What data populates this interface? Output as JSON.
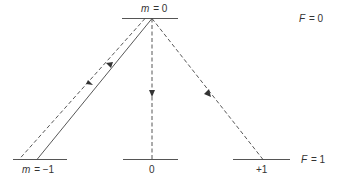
{
  "diagram": {
    "levels": {
      "upper": {
        "F_label": "F = 0",
        "F_symbol": "F",
        "F_value": "= 0",
        "sublevels": [
          {
            "m_label_symbol": "m",
            "m_label_value": "= 0"
          }
        ]
      },
      "lower": {
        "F_label": "F = 1",
        "F_symbol": "F",
        "F_value": "= 1",
        "sublevels": [
          {
            "m_label_symbol": "m",
            "m_label_value": "= −1"
          },
          {
            "m_label": "0"
          },
          {
            "m_label": "+1"
          }
        ]
      }
    },
    "transitions": [
      {
        "from": "F=1, m=-1",
        "to": "F=0, m=0",
        "style": "solid",
        "direction": "up"
      },
      {
        "from": "F=0, m=0",
        "to": "F=1, m=-1",
        "style": "dashed",
        "direction": "down"
      },
      {
        "from": "F=0, m=0",
        "to": "F=1, m=0",
        "style": "dashed",
        "direction": "down"
      },
      {
        "from": "F=0, m=0",
        "to": "F=1, m=+1",
        "style": "dashed",
        "direction": "down"
      }
    ],
    "colors": {
      "line": "#444444",
      "text": "#333333",
      "background": "#ffffff"
    }
  }
}
